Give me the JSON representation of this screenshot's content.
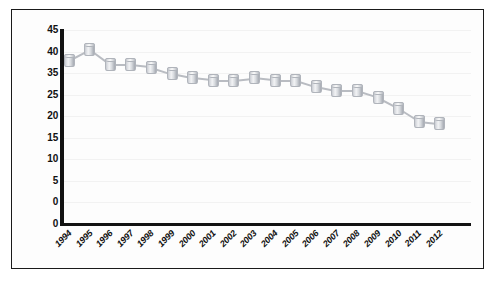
{
  "chart_data": {
    "type": "line",
    "title": "",
    "subtitle": "",
    "xlabel": "",
    "ylabel": "",
    "categories": [
      "1994",
      "1995",
      "1996",
      "1997",
      "1998",
      "1999",
      "2000",
      "2001",
      "2002",
      "2003",
      "2004",
      "2005",
      "2006",
      "2007",
      "2008",
      "2009",
      "2010",
      "2011",
      "2012"
    ],
    "values": [
      38.0,
      40.5,
      37.0,
      37.0,
      36.5,
      35.0,
      34.0,
      33.5,
      33.5,
      34.0,
      33.5,
      33.5,
      32.0,
      31.0,
      31.0,
      29.5,
      27.0,
      24.0,
      23.5
    ],
    "series": [
      {
        "name": "series-1",
        "values": [
          38.0,
          40.5,
          37.0,
          37.0,
          36.5,
          35.0,
          34.0,
          33.5,
          33.5,
          34.0,
          33.5,
          33.5,
          32.0,
          31.0,
          31.0,
          29.5,
          27.0,
          24.0,
          23.5
        ]
      }
    ],
    "ylim": [
      0,
      45
    ],
    "y_ticks": [
      45,
      40,
      35,
      30,
      25,
      20,
      15,
      10,
      5,
      0
    ],
    "y_tick_labels": [
      "45",
      "40",
      "35",
      "25",
      "20",
      "15",
      "10",
      "5",
      "0"
    ],
    "grid": false,
    "legend": "none",
    "marker_style": "3d-cylinder",
    "colors": {
      "marker_fill": "#dfe1e5",
      "marker_edge": "#b0b4bb",
      "line": "#b9bcc2",
      "axis": "#121212",
      "background": "#fdfdfd",
      "border": "#1a1a1a",
      "text": "#111111"
    }
  }
}
